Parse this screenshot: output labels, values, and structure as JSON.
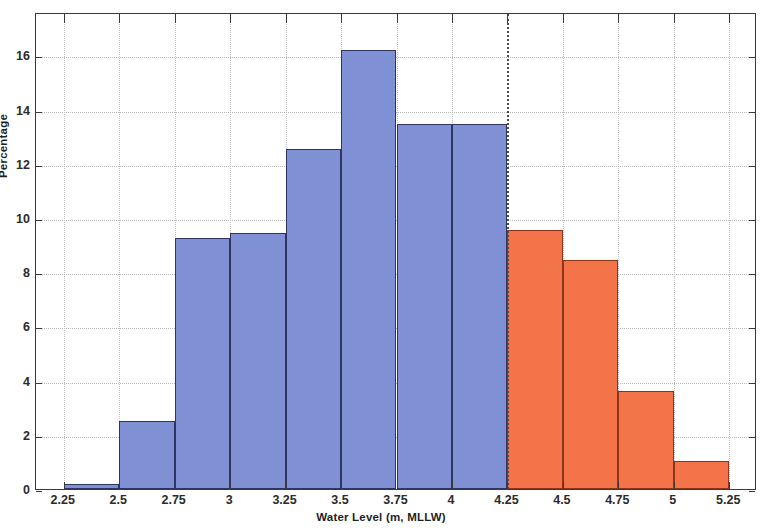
{
  "chart_data": {
    "type": "bar",
    "subtype": "histogram",
    "title": "",
    "xlabel": "Water Level (m, MLLW)",
    "ylabel": "Percentage",
    "xlim": [
      2.125,
      5.375
    ],
    "ylim": [
      0,
      17.6
    ],
    "grid": true,
    "legend": null,
    "xticks": [
      "2.25",
      "2.5",
      "2.75",
      "3",
      "3.25",
      "3.5",
      "3.75",
      "4",
      "4.25",
      "4.5",
      "4.75",
      "5",
      "5.25"
    ],
    "xtick_values": [
      2.25,
      2.5,
      2.75,
      3,
      3.25,
      3.5,
      3.75,
      4,
      4.25,
      4.5,
      4.75,
      5,
      5.25
    ],
    "yticks": [
      "0",
      "2",
      "4",
      "6",
      "8",
      "10",
      "12",
      "14",
      "16"
    ],
    "ytick_values": [
      0,
      2,
      4,
      6,
      8,
      10,
      12,
      14,
      16
    ],
    "bin_width": 0.25,
    "bin_edges": [
      2.25,
      2.5,
      2.75,
      3.0,
      3.25,
      3.5,
      3.75,
      4.0,
      4.25,
      4.5,
      4.75,
      5.0,
      5.25
    ],
    "categories": [
      "2.25-2.5",
      "2.5-2.75",
      "2.75-3",
      "3-3.25",
      "3.25-3.5",
      "3.5-3.75",
      "3.75-4",
      "4-4.25",
      "4.25-4.5",
      "4.5-4.75",
      "4.75-5",
      "5-5.25"
    ],
    "values": [
      0.2,
      2.5,
      9.25,
      9.45,
      12.55,
      16.2,
      13.45,
      13.45,
      9.55,
      8.45,
      3.6,
      1.05
    ],
    "bars": [
      {
        "x0": 2.25,
        "x1": 2.5,
        "value": 0.2,
        "color": "#7f90d4"
      },
      {
        "x0": 2.5,
        "x1": 2.75,
        "value": 2.5,
        "color": "#7f90d4"
      },
      {
        "x0": 2.75,
        "x1": 3.0,
        "value": 9.25,
        "color": "#7f90d4"
      },
      {
        "x0": 3.0,
        "x1": 3.25,
        "value": 9.45,
        "color": "#7f90d4"
      },
      {
        "x0": 3.25,
        "x1": 3.5,
        "value": 12.55,
        "color": "#7f90d4"
      },
      {
        "x0": 3.5,
        "x1": 3.75,
        "value": 16.2,
        "color": "#7f90d4"
      },
      {
        "x0": 3.75,
        "x1": 4.0,
        "value": 13.45,
        "color": "#7f90d4"
      },
      {
        "x0": 4.0,
        "x1": 4.25,
        "value": 13.45,
        "color": "#7f90d4"
      },
      {
        "x0": 4.25,
        "x1": 4.5,
        "value": 9.55,
        "color": "#f4744a"
      },
      {
        "x0": 4.5,
        "x1": 4.75,
        "value": 8.45,
        "color": "#f4744a"
      },
      {
        "x0": 4.75,
        "x1": 5.0,
        "value": 3.6,
        "color": "#f4744a"
      },
      {
        "x0": 5.0,
        "x1": 5.25,
        "value": 1.05,
        "color": "#f4744a"
      }
    ],
    "threshold_line": {
      "x": 4.25,
      "style": "dotted",
      "color": "#4a4a4a"
    },
    "colors": {
      "series_low": "#7f90d4",
      "series_low_edge": "#2d3560",
      "series_high": "#f4744a",
      "series_high_edge": "#8f3418",
      "axis": "#3a3a3a",
      "grid": "#b8b8b8",
      "background": "#ffffff"
    }
  }
}
